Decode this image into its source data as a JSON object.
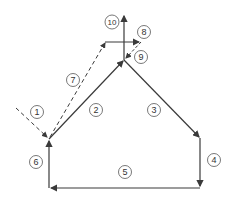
{
  "diagram": {
    "type": "flow-path",
    "stroke_color": "#3a3a3a",
    "labels": [
      {
        "id": "1",
        "text": "1",
        "x": 37,
        "y": 112
      },
      {
        "id": "2",
        "text": "2",
        "x": 96,
        "y": 110
      },
      {
        "id": "3",
        "text": "3",
        "x": 154,
        "y": 110
      },
      {
        "id": "4",
        "text": "4",
        "x": 214,
        "y": 160
      },
      {
        "id": "5",
        "text": "5",
        "x": 125,
        "y": 172
      },
      {
        "id": "6",
        "text": "6",
        "x": 36,
        "y": 162
      },
      {
        "id": "7",
        "text": "7",
        "x": 73,
        "y": 80
      },
      {
        "id": "8",
        "text": "8",
        "x": 144,
        "y": 32
      },
      {
        "id": "9",
        "text": "9",
        "x": 140,
        "y": 57
      },
      {
        "id": "10",
        "text": "10",
        "x": 112,
        "y": 22
      }
    ]
  }
}
